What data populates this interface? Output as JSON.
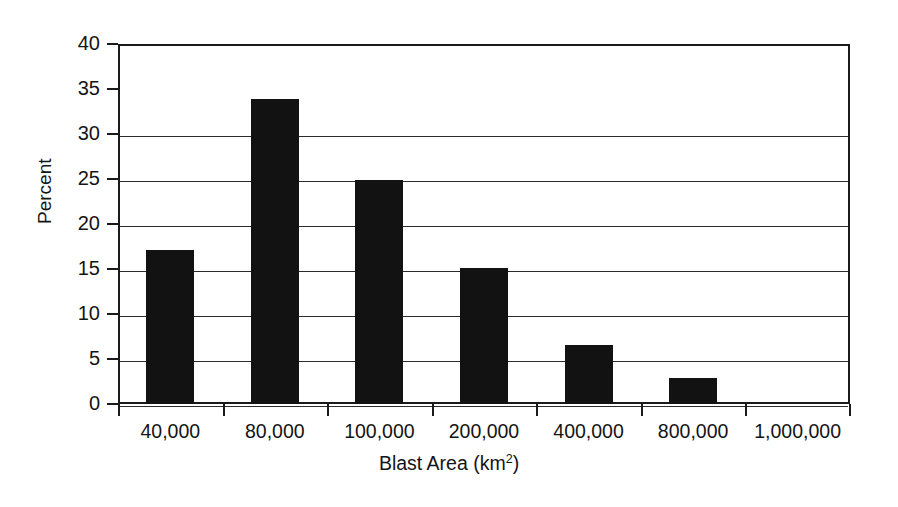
{
  "chart_data": {
    "type": "bar",
    "title": "",
    "subtitle": "",
    "xlabel": "Blast Area (km2)",
    "xlabel_base": "Blast Area (km",
    "xlabel_sup": "2",
    "xlabel_tail": ")",
    "ylabel": "Percent",
    "categories": [
      "40,000",
      "80,000",
      "100,000",
      "200,000",
      "400,000",
      "800,000",
      "1,000,000"
    ],
    "values": [
      17.1,
      33.9,
      24.9,
      15.1,
      6.6,
      2.9,
      0
    ],
    "ylim": [
      0,
      40
    ],
    "ytick_values": [
      0,
      5,
      10,
      15,
      20,
      25,
      30,
      35,
      40
    ],
    "ytick_labels": [
      "0",
      "5",
      "10",
      "15",
      "20",
      "25",
      "30",
      "35",
      "40"
    ],
    "grid": "horizontal",
    "legend": "none",
    "bar_color": "#121212",
    "axis_color": "#1a1a1a",
    "background_color": "#ffffff",
    "annotations": []
  }
}
